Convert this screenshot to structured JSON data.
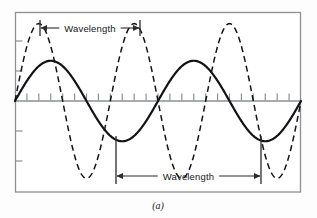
{
  "figure": {
    "caption": "(a)",
    "background_color": "#fdfdfd",
    "frame_color": "#8d8f93",
    "axis_color": "#8d8f93",
    "curve_color": "#121317",
    "label_color": "#15161a"
  },
  "annotations": {
    "top": {
      "label": "Wavelength",
      "arrow_style": "double-headed",
      "x_start_px": 40,
      "x_end_px": 140,
      "y_px": 28
    },
    "bottom": {
      "label": "Wavelength",
      "arrow_style": "double-headed",
      "x_start_px": 116,
      "x_end_px": 261,
      "y_px": 176
    }
  },
  "axes": {
    "frame": {
      "left_px": 15,
      "top_px": 12,
      "right_px": 301,
      "bottom_px": 192
    },
    "baseline_y_px": 101,
    "x_tick_count": 23,
    "x_tick_length_px": 7,
    "x_tick_direction": "up",
    "y_tick_positions_px": [
      41,
      71,
      131,
      161
    ],
    "y_tick_length_px": 7,
    "y_tick_direction": "right"
  },
  "chart_data": {
    "type": "line",
    "title": "",
    "subtitle": "",
    "xlabel": "",
    "ylabel": "",
    "grid": false,
    "legend": "none",
    "xlim": [
      0,
      1
    ],
    "ylim": [
      -1.15,
      1.15
    ],
    "annotations": [
      "Wavelength",
      "Wavelength",
      "(a)"
    ],
    "series": [
      {
        "name": "long-wavelength-wave",
        "style": "solid",
        "color": "#121317",
        "line_width_px": 2.2,
        "waveform": "sine",
        "amplitude": 0.52,
        "cycles": 2.0,
        "phase_deg": 0,
        "wavelength_px": 145,
        "x": [
          0.0,
          0.05,
          0.1,
          0.15,
          0.2,
          0.25,
          0.3,
          0.35,
          0.4,
          0.45,
          0.5,
          0.55,
          0.6,
          0.65,
          0.7,
          0.75,
          0.8,
          0.85,
          0.9,
          0.95,
          1.0
        ],
        "y": [
          0.0,
          0.31,
          0.48,
          0.52,
          0.42,
          0.2,
          -0.08,
          -0.34,
          -0.49,
          -0.52,
          -0.4,
          -0.17,
          0.12,
          0.37,
          0.5,
          0.52,
          0.4,
          0.18,
          -0.12,
          -0.38,
          -0.5
        ]
      },
      {
        "name": "short-wavelength-wave",
        "style": "dashed",
        "color": "#121317",
        "line_width_px": 1.5,
        "dash_pattern": "6 4",
        "waveform": "sine",
        "amplitude": 1.0,
        "cycles": 3.0,
        "phase_deg": 0,
        "wavelength_px": 100,
        "x": [
          0.0,
          0.05,
          0.1,
          0.15,
          0.2,
          0.25,
          0.3,
          0.35,
          0.4,
          0.45,
          0.5,
          0.55,
          0.6,
          0.65,
          0.7,
          0.75,
          0.8,
          0.85,
          0.9,
          0.95,
          1.0
        ],
        "y": [
          0.0,
          0.71,
          1.0,
          0.71,
          0.0,
          -0.71,
          -1.0,
          -0.71,
          0.0,
          0.71,
          1.0,
          0.71,
          0.0,
          -0.71,
          -1.0,
          -0.71,
          0.0,
          0.71,
          1.0,
          0.71,
          0.0
        ]
      }
    ]
  }
}
